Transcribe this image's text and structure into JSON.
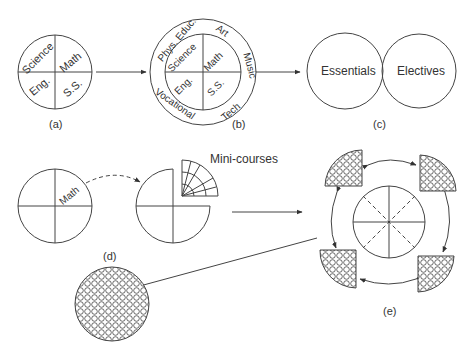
{
  "panels": {
    "a": {
      "caption": "(a)",
      "quadrants": [
        "Science",
        "Math",
        "Eng.",
        "S.S."
      ]
    },
    "b": {
      "caption": "(b)",
      "quadrants": [
        "Science",
        "Math",
        "Eng.",
        "S.S."
      ],
      "ring": [
        "Phys. Educ.",
        "Art",
        "Music",
        "Tech",
        "Vocational"
      ]
    },
    "c": {
      "caption": "(c)",
      "circles": [
        "Essentials",
        "Electives"
      ]
    },
    "d": {
      "caption": "(d)",
      "quadrant_label": "Math",
      "mini_label": "Mini-courses"
    },
    "e": {
      "caption": "(e)"
    }
  },
  "colors": {
    "stroke": "#444444",
    "background": "#ffffff"
  }
}
